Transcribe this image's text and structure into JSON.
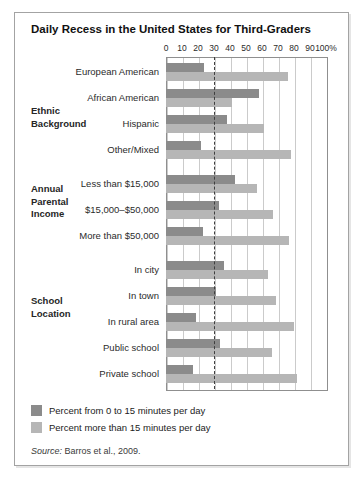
{
  "figure": {
    "title": "Daily Recess in the United States for Third-Graders",
    "source_prefix": "Source:",
    "source_text": " Barros et al., 2009."
  },
  "legend": [
    {
      "label": "Percent from 0 to 15 minutes per day",
      "color": "#8b8b8b"
    },
    {
      "label": "Percent more than 15 minutes per day",
      "color": "#b6b6b6"
    }
  ],
  "colors": {
    "bar_0_to_15": "#8b8b8b",
    "bar_more_than_15": "#b6b6b6",
    "gridline": "#cbcbcb",
    "reference_line": "#3f3f3f"
  },
  "chart_data": {
    "type": "bar",
    "orientation": "horizontal",
    "title": "Daily Recess in the United States for Third-Graders",
    "xlim": [
      0,
      100
    ],
    "x_ticks": [
      "0",
      "10",
      "20",
      "30",
      "40",
      "50",
      "60",
      "70",
      "80",
      "90",
      "100%"
    ],
    "grid": true,
    "reference_line_x": 30,
    "legend_position": "bottom-left",
    "series_names": [
      "Percent from 0 to 15 minutes per day",
      "Percent more than 15 minutes per day"
    ],
    "groups": [
      {
        "label": "Ethnic Background",
        "rows": [
          {
            "category": "European American",
            "values": [
              24,
              76
            ]
          },
          {
            "category": "African American",
            "values": [
              58,
              41
            ]
          },
          {
            "category": "Hispanic",
            "values": [
              38,
              61
            ]
          },
          {
            "category": "Other/Mixed",
            "values": [
              22,
              78
            ]
          }
        ]
      },
      {
        "label": "Annual Parental Income",
        "rows": [
          {
            "category": "Less than $15,000",
            "values": [
              43,
              57
            ]
          },
          {
            "category": "$15,000–$50,000",
            "values": [
              33,
              67
            ]
          },
          {
            "category": "More than $50,000",
            "values": [
              23,
              77
            ]
          }
        ]
      },
      {
        "label": "School Location",
        "rows": [
          {
            "category": "In city",
            "values": [
              36,
              64
            ]
          },
          {
            "category": "In town",
            "values": [
              31,
              69
            ]
          },
          {
            "category": "In rural area",
            "values": [
              19,
              80
            ]
          },
          {
            "category": "Public school",
            "values": [
              34,
              66
            ]
          },
          {
            "category": "Private school",
            "values": [
              17,
              82
            ]
          }
        ]
      }
    ],
    "source": "Source: Barros et al., 2009."
  }
}
